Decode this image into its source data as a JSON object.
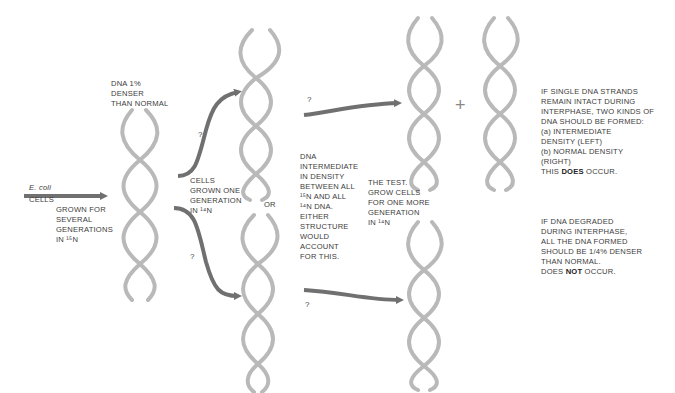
{
  "diagram": {
    "colors": {
      "strand": "#b9b9b9",
      "strand_dark": "#a8a8a8",
      "arrow": "#707070",
      "text": "#3c3c3c"
    },
    "labels": {
      "ecoli": "E. coli",
      "cells": "CELLS",
      "grown_several": [
        "GROWN FOR",
        "SEVERAL",
        "GENERATIONS",
        "IN ¹⁵N"
      ],
      "dna_denser": [
        "DNA 1%",
        "DENSER",
        "THAN NORMAL"
      ],
      "grown_one": [
        "CELLS",
        "GROWN ONE",
        "GENERATION",
        "IN ¹⁴N"
      ],
      "or": "OR",
      "intermediate": [
        "DNA",
        "INTERMEDIATE",
        "IN DENSITY",
        "BETWEEN ALL",
        "¹⁵N AND ALL",
        "¹⁴N DNA.",
        "EITHER",
        "STRUCTURE",
        "WOULD",
        "ACCOUNT",
        "FOR THIS."
      ],
      "test": [
        "THE TEST.",
        "GROW CELLS",
        "FOR ONE MORE",
        "GENERATION",
        "IN ¹⁴N"
      ],
      "intact": [
        "IF SINGLE DNA STRANDS",
        "REMAIN INTACT DURING",
        "INTERPHASE, TWO KINDS OF",
        "DNA SHOULD BE FORMED:",
        "(a) INTERMEDIATE",
        "DENSITY (LEFT)",
        "(b) NORMAL DENSITY",
        "(RIGHT)"
      ],
      "intact_result_pre": "THIS ",
      "intact_result_bold": "DOES",
      "intact_result_post": " OCCUR.",
      "degraded": [
        "IF DNA DEGRADED",
        "DURING INTERPHASE,",
        "ALL THE DNA FORMED",
        "SHOULD BE 1/4% DENSER",
        "THAN NORMAL."
      ],
      "degraded_result_pre": "DOES ",
      "degraded_result_bold": "NOT",
      "degraded_result_post": " OCCUR.",
      "question": "?",
      "plus": "+"
    }
  }
}
